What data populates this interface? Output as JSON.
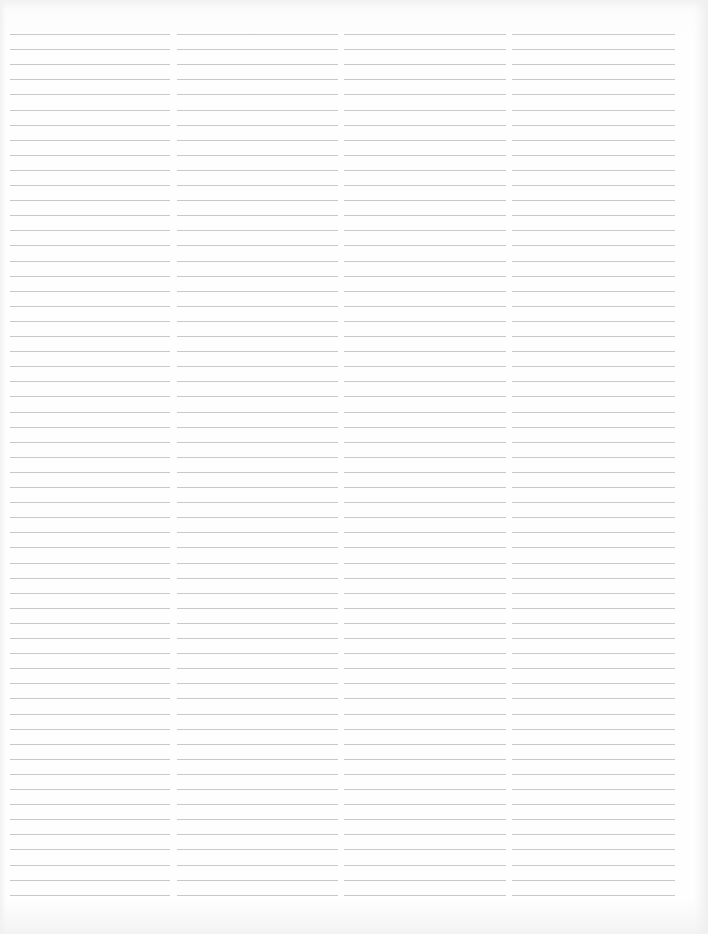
{
  "page": {
    "type": "blank ruled sheet",
    "background_color": "#fefefe",
    "rule_color": "#c9c9c9"
  },
  "layout": {
    "columns": [
      {
        "id": "col-1",
        "left": 10,
        "width": 160
      },
      {
        "id": "col-2",
        "left": 177,
        "width": 161
      },
      {
        "id": "col-3",
        "left": 344,
        "width": 162
      },
      {
        "id": "col-4",
        "left": 512,
        "width": 163
      }
    ],
    "first_rule_y": 34,
    "rule_spacing": 15.1,
    "rule_count": 58
  }
}
